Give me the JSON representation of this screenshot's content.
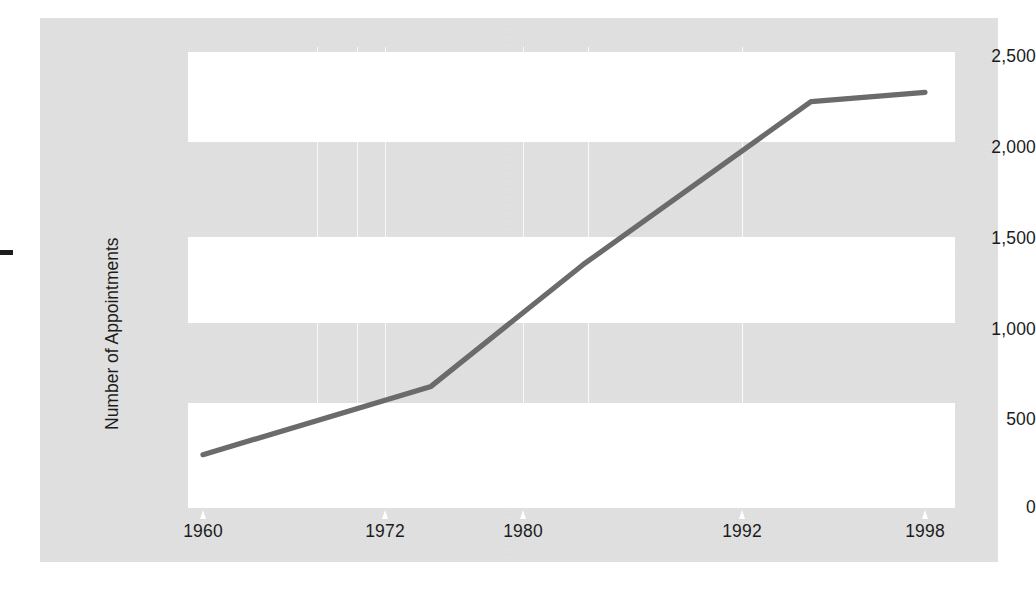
{
  "figure": {
    "background_color": "#e2e2e2",
    "plot_band_color": "#ffffff",
    "line_color": "#6b6b6b"
  },
  "chart_data": {
    "type": "line",
    "title": "",
    "subtitle": "",
    "xlabel": "",
    "ylabel": "Number of Appointments",
    "x": [
      1960,
      1972,
      1980,
      1992,
      1998
    ],
    "categories": [
      "1960",
      "1972",
      "1980",
      "1992",
      "1998"
    ],
    "values": [
      460,
      830,
      1490,
      2375,
      2425
    ],
    "series": [
      {
        "name": "Number of Appointments",
        "values": [
          460,
          830,
          1490,
          2375,
          2425
        ]
      }
    ],
    "xtick_labels": [
      "1960",
      "1972",
      "1980",
      "1992",
      "1998"
    ],
    "ytick_labels": [
      "0",
      "500",
      "1,000",
      "1,500",
      "2,000",
      "2,500"
    ],
    "ytick_values": [
      0,
      500,
      1000,
      1500,
      2000,
      2500
    ],
    "ylim": [
      0,
      2500
    ],
    "xlim": [
      1960,
      1998
    ],
    "grid": "horizontal-bands",
    "legend": "none",
    "legend_position": "none",
    "annotations": []
  },
  "axes": {
    "y_title": "Number of Appointments",
    "y_ticks": [
      {
        "label": "2,500",
        "value": 2500
      },
      {
        "label": "2,000",
        "value": 2000
      },
      {
        "label": "1,500",
        "value": 1500
      },
      {
        "label": "1,000",
        "value": 1000
      },
      {
        "label": "500",
        "value": 500
      },
      {
        "label": "0",
        "value": 0
      }
    ],
    "x_ticks": [
      {
        "label": "1960",
        "value": 1960
      },
      {
        "label": "1972",
        "value": 1972
      },
      {
        "label": "1980",
        "value": 1980
      },
      {
        "label": "1992",
        "value": 1992
      },
      {
        "label": "1998",
        "value": 1998
      }
    ]
  }
}
